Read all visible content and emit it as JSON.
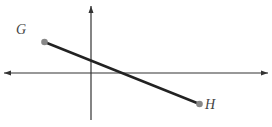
{
  "diagram": {
    "type": "coordinate-plane-segment",
    "grid": {
      "x_min": -5,
      "x_max": 11,
      "y_min": -3,
      "y_max": 4,
      "line_color": "#c8c8c8"
    },
    "axes": {
      "x_label": "x",
      "y_label": "y",
      "origin_label": "O",
      "color": "#333333"
    },
    "ticks": [
      {
        "axis": "x",
        "value": -3,
        "label": "−3"
      },
      {
        "axis": "x",
        "value": 7,
        "label": "7"
      },
      {
        "axis": "y",
        "value": 3,
        "label": "3"
      },
      {
        "axis": "y",
        "value": -2,
        "label": "−2"
      }
    ],
    "points": [
      {
        "name": "G",
        "x": -3,
        "y": 2,
        "label": "G(−3, 2)"
      },
      {
        "name": "H",
        "x": 7,
        "y": -2,
        "label": "H(7, −2)"
      }
    ],
    "segment": {
      "from": "G",
      "to": "H",
      "color": "#222222"
    },
    "point_color": "#888888"
  }
}
